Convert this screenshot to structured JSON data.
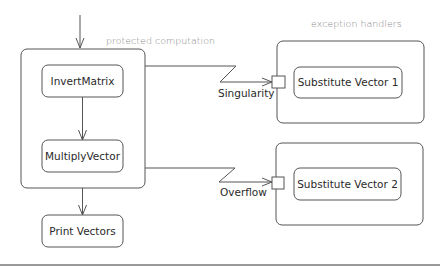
{
  "diagram": {
    "type": "UML activity diagram - exception handling",
    "regions": {
      "protected": {
        "caption": "protected computation"
      },
      "handlers": {
        "caption": "exception handlers"
      }
    },
    "nodes": {
      "invert_matrix": "InvertMatrix",
      "multiply_vector": "MultiplyVector",
      "print_vectors": "Print Vectors",
      "substitute_vector_1": "Substitute Vector 1",
      "substitute_vector_2": "Substitute Vector 2"
    },
    "exceptions": {
      "singularity": "Singularity",
      "overflow": "Overflow"
    },
    "colors": {
      "stroke": "#555555",
      "text": "#2a2a2a",
      "caption": "#8a8a8a",
      "background": "#ffffff"
    }
  }
}
